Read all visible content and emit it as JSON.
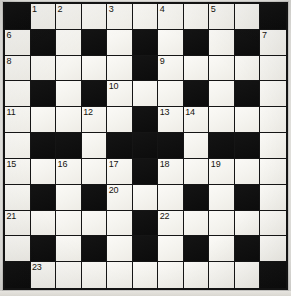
{
  "puzzle": {
    "title": "Crossword Grid",
    "rows": 11,
    "columns": 11,
    "cell_size_px": 25,
    "colors": {
      "block": "#111111",
      "open": "#f7f6f2",
      "grid_line": "#151515",
      "number_text": "#15140f",
      "paper": "#efeeea"
    },
    "legend": {
      "block_label": "blocked-square",
      "open_label": "open-square"
    },
    "grid": [
      [
        "block",
        "open",
        "open",
        "open",
        "open",
        "open",
        "open",
        "open",
        "open",
        "open",
        "block"
      ],
      [
        "open",
        "block",
        "open",
        "block",
        "open",
        "block",
        "open",
        "block",
        "open",
        "block",
        "open"
      ],
      [
        "open",
        "open",
        "open",
        "open",
        "open",
        "block",
        "open",
        "open",
        "open",
        "open",
        "open"
      ],
      [
        "open",
        "block",
        "open",
        "block",
        "open",
        "open",
        "open",
        "block",
        "open",
        "block",
        "open"
      ],
      [
        "open",
        "open",
        "open",
        "open",
        "open",
        "block",
        "open",
        "open",
        "open",
        "open",
        "open"
      ],
      [
        "open",
        "block",
        "block",
        "open",
        "block",
        "block",
        "block",
        "open",
        "block",
        "block",
        "open"
      ],
      [
        "open",
        "open",
        "open",
        "open",
        "open",
        "block",
        "open",
        "open",
        "open",
        "open",
        "open"
      ],
      [
        "open",
        "block",
        "open",
        "block",
        "open",
        "open",
        "open",
        "block",
        "open",
        "block",
        "open"
      ],
      [
        "open",
        "open",
        "open",
        "open",
        "open",
        "block",
        "open",
        "open",
        "open",
        "open",
        "open"
      ],
      [
        "open",
        "block",
        "open",
        "block",
        "open",
        "block",
        "open",
        "block",
        "open",
        "block",
        "open"
      ],
      [
        "block",
        "open",
        "open",
        "open",
        "open",
        "open",
        "open",
        "open",
        "open",
        "open",
        "block"
      ]
    ],
    "numbers": [
      {
        "row": 0,
        "col": 1,
        "label": "1"
      },
      {
        "row": 0,
        "col": 2,
        "label": "2"
      },
      {
        "row": 0,
        "col": 4,
        "label": "3"
      },
      {
        "row": 0,
        "col": 6,
        "label": "4"
      },
      {
        "row": 0,
        "col": 8,
        "label": "5"
      },
      {
        "row": 1,
        "col": 0,
        "label": "6"
      },
      {
        "row": 1,
        "col": 10,
        "label": "7"
      },
      {
        "row": 2,
        "col": 0,
        "label": "8"
      },
      {
        "row": 2,
        "col": 6,
        "label": "9"
      },
      {
        "row": 3,
        "col": 4,
        "label": "10"
      },
      {
        "row": 4,
        "col": 0,
        "label": "11"
      },
      {
        "row": 4,
        "col": 3,
        "label": "12"
      },
      {
        "row": 4,
        "col": 6,
        "label": "13"
      },
      {
        "row": 4,
        "col": 7,
        "label": "14"
      },
      {
        "row": 6,
        "col": 0,
        "label": "15"
      },
      {
        "row": 6,
        "col": 2,
        "label": "16"
      },
      {
        "row": 6,
        "col": 4,
        "label": "17"
      },
      {
        "row": 6,
        "col": 6,
        "label": "18"
      },
      {
        "row": 6,
        "col": 8,
        "label": "19"
      },
      {
        "row": 7,
        "col": 4,
        "label": "20"
      },
      {
        "row": 8,
        "col": 0,
        "label": "21"
      },
      {
        "row": 8,
        "col": 6,
        "label": "22"
      },
      {
        "row": 10,
        "col": 1,
        "label": "23"
      }
    ],
    "entries": []
  }
}
